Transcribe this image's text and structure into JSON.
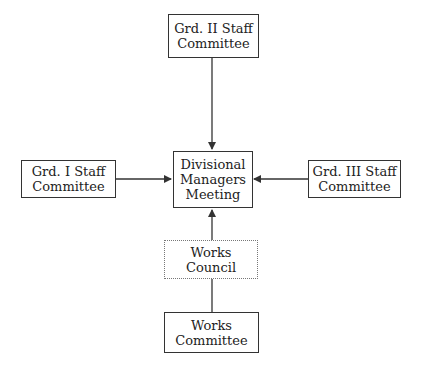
{
  "diagram": {
    "type": "organizational-flow",
    "nodes": [
      {
        "id": "grd2",
        "lines": [
          "Grd. II Staff",
          "Committee"
        ],
        "border": "solid"
      },
      {
        "id": "grd1",
        "lines": [
          "Grd. I Staff",
          "Committee"
        ],
        "border": "solid"
      },
      {
        "id": "div",
        "lines": [
          "Divisional",
          "Managers",
          "Meeting"
        ],
        "border": "solid"
      },
      {
        "id": "grd3",
        "lines": [
          "Grd. III Staff",
          "Committee"
        ],
        "border": "solid"
      },
      {
        "id": "council",
        "lines": [
          "Works",
          "Council"
        ],
        "border": "dotted"
      },
      {
        "id": "committee",
        "lines": [
          "Works",
          "Committee"
        ],
        "border": "solid"
      }
    ],
    "edges": [
      {
        "from": "grd2",
        "to": "div",
        "arrow": true
      },
      {
        "from": "grd1",
        "to": "div",
        "arrow": true
      },
      {
        "from": "grd3",
        "to": "div",
        "arrow": true
      },
      {
        "from": "council",
        "to": "div",
        "arrow": true
      },
      {
        "from": "committee",
        "to": "council",
        "arrow": false
      }
    ]
  }
}
